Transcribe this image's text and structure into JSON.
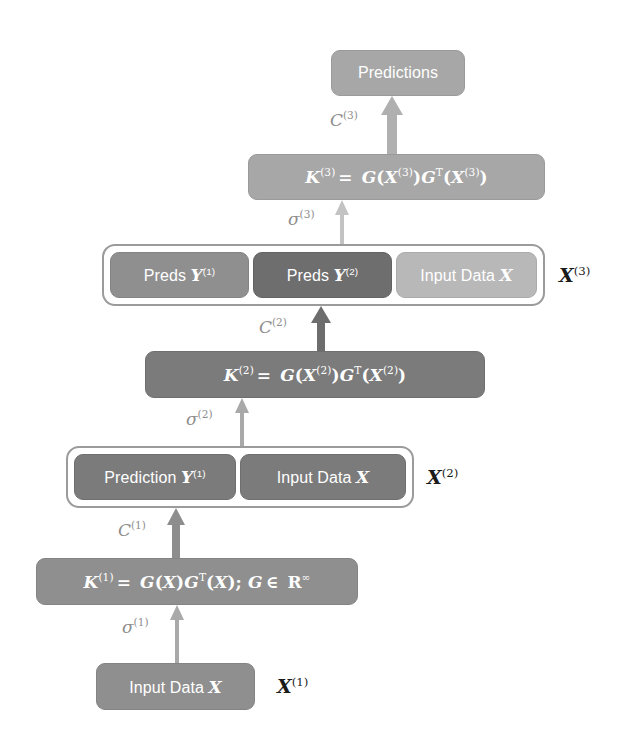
{
  "diagram": {
    "colors": {
      "background": "#ffffff",
      "light_gray": "#a7a7a7",
      "mid_gray": "#8f8f8f",
      "dark_gray": "#7b7b7b",
      "darker_gray": "#6e6e6e",
      "pale_gray": "#b8b8b8",
      "group_border": "#9b9b9b",
      "text_on_box": "#ffffff",
      "annotation_text": "#1a1a1a",
      "edge_label_text": "#8e8e8e"
    }
  },
  "nodes": {
    "predictions": {
      "label": "Predictions"
    },
    "k3": {
      "lhs": "K",
      "lhs_sup": "(3)",
      "equals": "=",
      "rhs_g1": "G",
      "rhs_x1": "X",
      "rhs_x1_sup": "(3)",
      "rhs_g2": "G",
      "rhs_g2_sup": "T",
      "rhs_x2": "X",
      "rhs_x2_sup": "(3)",
      "full_text": "K(3) = G(X(3))GT(X(3))"
    },
    "k2": {
      "lhs": "K",
      "lhs_sup": "(2)",
      "equals": "=",
      "rhs_g1": "G",
      "rhs_x1": "X",
      "rhs_x1_sup": "(2)",
      "rhs_g2": "G",
      "rhs_g2_sup": "T",
      "rhs_x2": "X",
      "rhs_x2_sup": "(2)",
      "full_text": "K(2) = G(X(2))GT(X(2))"
    },
    "k1": {
      "lhs": "K",
      "lhs_sup": "(1)",
      "equals": "=",
      "rhs_g1": "G",
      "rhs_x1": "X",
      "rhs_g2": "G",
      "rhs_g2_sup": "T",
      "rhs_x2": "X",
      "semicolon": ";",
      "member_g": "G",
      "member_op": "∈",
      "member_space": "R",
      "member_sup": "∞",
      "full_text": "K(1) = G(X)GT(X); G ∈ R∞"
    },
    "x3_row": {
      "group_label": "X",
      "group_label_sup": "(3)",
      "cells": [
        {
          "prefix": "Preds",
          "var": "Y",
          "var_sup": "(1)",
          "shade": "mid"
        },
        {
          "prefix": "Preds",
          "var": "Y",
          "var_sup": "(2)",
          "shade": "darker"
        },
        {
          "prefix": "Input Data",
          "var": "X",
          "var_sup": "",
          "shade": "pale"
        }
      ]
    },
    "x2_row": {
      "group_label": "X",
      "group_label_sup": "(2)",
      "cells": [
        {
          "prefix": "Prediction",
          "var": "Y",
          "var_sup": "(1)",
          "shade": "dark"
        },
        {
          "prefix": "Input Data",
          "var": "X",
          "var_sup": "",
          "shade": "dark"
        }
      ]
    },
    "x1_row": {
      "group_label": "X",
      "group_label_sup": "(1)",
      "cells": [
        {
          "prefix": "Input Data",
          "var": "X",
          "var_sup": "",
          "shade": "mid"
        }
      ]
    }
  },
  "edges": [
    {
      "id": "sigma1",
      "symbol": "σ",
      "sup": "(1)",
      "from": "x1_row",
      "to": "k1",
      "style": "thin-light"
    },
    {
      "id": "c1",
      "symbol": "C",
      "sup": "(1)",
      "from": "k1",
      "to": "x2_row",
      "style": "thick-mid"
    },
    {
      "id": "sigma2",
      "symbol": "σ",
      "sup": "(2)",
      "from": "x2_row",
      "to": "k2",
      "style": "thin-light"
    },
    {
      "id": "c2",
      "symbol": "C",
      "sup": "(2)",
      "from": "k2",
      "to": "x3_row",
      "style": "thick-dark"
    },
    {
      "id": "sigma3",
      "symbol": "σ",
      "sup": "(3)",
      "from": "x3_row",
      "to": "k3",
      "style": "thin-light"
    },
    {
      "id": "c3",
      "symbol": "C",
      "sup": "(3)",
      "from": "k3",
      "to": "predictions",
      "style": "thick-light"
    }
  ]
}
